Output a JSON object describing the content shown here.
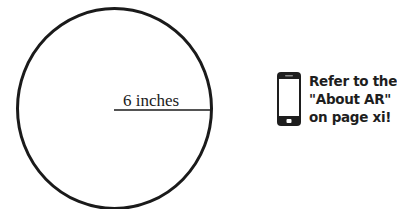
{
  "diagram": {
    "shape": "circle",
    "radius_label": "6 inches",
    "stroke_color": "#1a1a1a"
  },
  "ar_note": {
    "icon": "smartphone-icon",
    "lines": [
      "Refer to the",
      "\"About AR\"",
      "on page xi!"
    ]
  }
}
